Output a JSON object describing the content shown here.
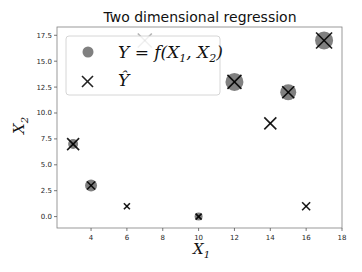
{
  "chart_data": {
    "type": "scatter",
    "title": "Two dimensional regression",
    "xlabel": "X_1",
    "ylabel": "X_2",
    "xlim": [
      2.1,
      18
    ],
    "ylim": [
      -1.1,
      18.3
    ],
    "xticks": [
      4,
      6,
      8,
      10,
      12,
      14,
      16,
      18
    ],
    "xtick_labels": [
      "4",
      "6",
      "8",
      "10",
      "12",
      "14",
      "16",
      "18"
    ],
    "yticks": [
      0,
      2.5,
      5,
      7.5,
      10,
      12.5,
      15,
      17.5
    ],
    "ytick_labels": [
      "0.0",
      "2.5",
      "5.0",
      "7.5",
      "10.0",
      "12.5",
      "15.0",
      "17.5"
    ],
    "grid": false,
    "legend_position": "upper left",
    "series": [
      {
        "name": "Y = f(X_1, X_2)",
        "marker": "circle",
        "color": "#808080",
        "x": [
          3,
          4,
          10,
          12,
          15,
          17
        ],
        "y": [
          7,
          3,
          0,
          13,
          12,
          17
        ],
        "size": [
          5,
          6,
          4,
          9,
          8,
          9
        ]
      },
      {
        "name": "Y-hat",
        "marker": "x",
        "color": "#000000",
        "x": [
          3,
          4,
          6,
          7,
          10,
          12,
          14,
          15,
          16,
          17
        ],
        "y": [
          7,
          3,
          1,
          17,
          0,
          13,
          9,
          12,
          1,
          17
        ],
        "size": [
          6,
          4,
          3,
          7,
          3,
          7,
          6,
          6,
          4,
          8
        ]
      }
    ]
  },
  "legend": {
    "entries": [
      {
        "label_main": "Y = f(X",
        "sub1": "1",
        "mid": ", X",
        "sub2": "2",
        "tail": ")"
      },
      {
        "label_main": "Ŷ"
      }
    ]
  },
  "labels": {
    "title": "Two dimensional regression",
    "x_main": "X",
    "x_sub": "1",
    "y_main": "X",
    "y_sub": "2"
  }
}
